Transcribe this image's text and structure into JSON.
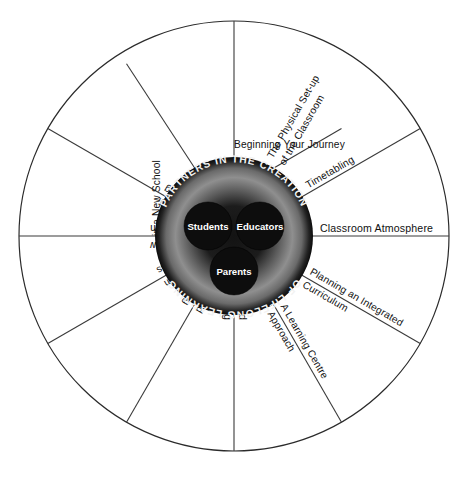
{
  "diagram": {
    "hub": {
      "arc_top_text": "PARTNERS IN THE CREATION",
      "arc_bottom_text": "OF LIFELONG LEARNING",
      "nodes": [
        {
          "label": "Students"
        },
        {
          "label": "Educators"
        },
        {
          "label": "Parents"
        }
      ]
    },
    "segments": [
      {
        "id": "beginning-your-journey",
        "lines": [
          "Beginning Your Journey",
          "in a New School"
        ]
      },
      {
        "id": "physical-set-up",
        "lines": [
          "The Physical Set-up",
          "of the Classroom"
        ]
      },
      {
        "id": "timetabling",
        "lines": [
          "Timetabling"
        ]
      },
      {
        "id": "classroom-atmosphere",
        "lines": [
          "Classroom Atmosphere"
        ]
      },
      {
        "id": "planning-integrated-curriculum",
        "lines": [
          "Planning an Integrated",
          "Curriculum"
        ]
      },
      {
        "id": "learning-centre-approach",
        "lines": [
          "A Learning Centre",
          "Approach"
        ]
      },
      {
        "id": "literacy-and-language-learning",
        "lines": [
          "Literacy and",
          "Language Learning"
        ]
      },
      {
        "id": "technology-and-learning",
        "lines": [
          "Technology and",
          "Learning"
        ]
      },
      {
        "id": "out-of-classroom-excursions",
        "lines": [
          "Out-of-Classroom",
          "Excursions"
        ]
      },
      {
        "id": "homework-a-window",
        "lines": [
          "Homework: A Window",
          "into the Classroom"
        ]
      },
      {
        "id": "assessing-evaluating-reporting",
        "lines": [
          "Assessing, Evaluating,",
          "and Reporting"
        ]
      },
      {
        "id": "partnerships-with-parents",
        "lines": [
          "Partnerships",
          "with Parents"
        ]
      }
    ],
    "colors": {
      "outline": "#2b2b2b",
      "spoke": "#3a3a3a",
      "hub_outer": "#111111",
      "hub_mid": "#8a8a8a",
      "hub_inner": "#141414",
      "node_fill": "#0d0d0d",
      "node_text": "#ffffff",
      "arc_text": "#f2f2f2",
      "background": "#ffffff"
    }
  }
}
